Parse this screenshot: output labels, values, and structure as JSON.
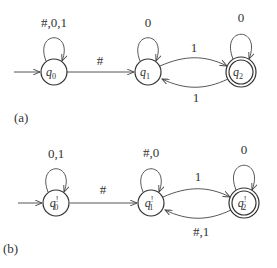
{
  "diagrams": [
    {
      "caption": "(a)",
      "states": [
        {
          "id": "q0",
          "label": "q",
          "sub": "0",
          "prime": "",
          "accepting": false,
          "start": true
        },
        {
          "id": "q1",
          "label": "q",
          "sub": "1",
          "prime": "",
          "accepting": false,
          "start": false
        },
        {
          "id": "q2",
          "label": "q",
          "sub": "2",
          "prime": "",
          "accepting": true,
          "start": false
        }
      ],
      "transitions": [
        {
          "from": "q0",
          "to": "q0",
          "label": "#,0,1"
        },
        {
          "from": "q0",
          "to": "q1",
          "label": "#"
        },
        {
          "from": "q1",
          "to": "q1",
          "label": "0"
        },
        {
          "from": "q1",
          "to": "q2",
          "label": "1"
        },
        {
          "from": "q2",
          "to": "q1",
          "label": "1"
        },
        {
          "from": "q2",
          "to": "q2",
          "label": "0"
        }
      ]
    },
    {
      "caption": "(b)",
      "states": [
        {
          "id": "q0p",
          "label": "q",
          "sub": "0",
          "prime": "!",
          "accepting": false,
          "start": true
        },
        {
          "id": "q1p",
          "label": "q",
          "sub": "1",
          "prime": "!",
          "accepting": false,
          "start": false
        },
        {
          "id": "q2p",
          "label": "q",
          "sub": "2",
          "prime": "!",
          "accepting": true,
          "start": false
        }
      ],
      "transitions": [
        {
          "from": "q0p",
          "to": "q0p",
          "label": "0,1"
        },
        {
          "from": "q0p",
          "to": "q1p",
          "label": "#"
        },
        {
          "from": "q1p",
          "to": "q1p",
          "label": "#,0"
        },
        {
          "from": "q1p",
          "to": "q2p",
          "label": "1"
        },
        {
          "from": "q2p",
          "to": "q1p",
          "label": "#,1"
        },
        {
          "from": "q2p",
          "to": "q2p",
          "label": "0"
        }
      ]
    }
  ]
}
